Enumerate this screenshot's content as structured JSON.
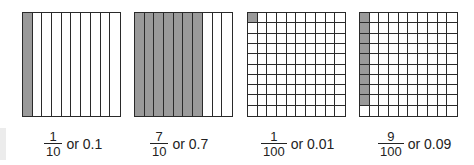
{
  "colors": {
    "shaded": "#9a9a9a",
    "line": "#2a2a2a",
    "background": "#ffffff"
  },
  "models": [
    {
      "type": "tenths",
      "shaded_columns": 1,
      "numerator": "1",
      "denominator": "10",
      "decimal_text": "or 0.1",
      "value": 0.1
    },
    {
      "type": "tenths",
      "shaded_columns": 7,
      "numerator": "7",
      "denominator": "10",
      "decimal_text": "or 0.7",
      "value": 0.7
    },
    {
      "type": "hundredths",
      "shaded_cells": 1,
      "numerator": "1",
      "denominator": "100",
      "decimal_text": "or 0.01",
      "value": 0.01
    },
    {
      "type": "hundredths",
      "shaded_cells": 9,
      "numerator": "9",
      "denominator": "100",
      "decimal_text": "or 0.09",
      "value": 0.09
    }
  ]
}
